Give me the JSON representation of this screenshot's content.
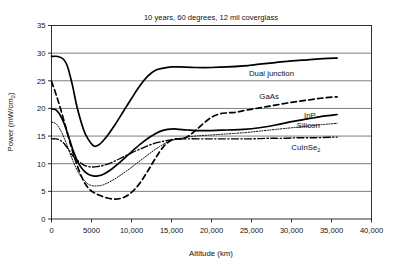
{
  "chart_data": {
    "type": "line",
    "title": "10 years, 60 degrees, 12 mil coverglass",
    "xlabel": "Altitude (km)",
    "ylabel": "Power (mW/cm2)",
    "ylabel_display": "Power (mW/cm",
    "ylabel_sub": "2",
    "ylabel_tail": ")",
    "xlim": [
      0,
      40000
    ],
    "ylim": [
      0,
      35
    ],
    "grid": "horizontal",
    "legend_position": "inline-right-annotations",
    "xticks": [
      0,
      5000,
      10000,
      15000,
      20000,
      25000,
      30000,
      35000,
      40000
    ],
    "xticklabels": [
      "0",
      "5000",
      "10,000",
      "15,000",
      "20,000",
      "25,000",
      "30,000",
      "35,000",
      "40,000"
    ],
    "yticks": [
      0,
      5,
      10,
      15,
      20,
      25,
      30,
      35
    ],
    "yticklabels": [
      "0",
      "5",
      "10",
      "15",
      "20",
      "25",
      "30",
      "35"
    ],
    "series": [
      {
        "name": "Dual junction",
        "style": "solid",
        "label_x": 27500,
        "label_y": 26.4,
        "x": [
          0,
          800,
          1500,
          2000,
          2600,
          3200,
          4000,
          4600,
          5300,
          6000,
          7000,
          8000,
          9000,
          10000,
          11000,
          12000,
          13000,
          14000,
          15000,
          16000,
          18000,
          20000,
          22000,
          24000,
          26000,
          28000,
          30000,
          32000,
          34000,
          35700
        ],
        "y": [
          29.4,
          29.4,
          28.9,
          27.6,
          24.3,
          20.2,
          16.2,
          14.4,
          13.2,
          13.5,
          15.1,
          17.2,
          19.5,
          21.8,
          24.0,
          25.8,
          26.9,
          27.3,
          27.5,
          27.5,
          27.4,
          27.4,
          27.5,
          27.7,
          28.0,
          28.3,
          28.6,
          28.8,
          29.0,
          29.1
        ]
      },
      {
        "name": "GaAs",
        "style": "dashed",
        "label_x": 27200,
        "label_y": 22.2,
        "x": [
          0,
          600,
          1200,
          1800,
          2400,
          3000,
          3600,
          4200,
          4800,
          5400,
          6000,
          7000,
          8000,
          9000,
          10000,
          11000,
          12000,
          13000,
          14000,
          15000,
          15600,
          16200,
          17000,
          18000,
          19000,
          20000,
          21000,
          22000,
          23000,
          24000,
          26000,
          28000,
          30000,
          32000,
          34000,
          35700
        ],
        "y": [
          24.9,
          22.4,
          19.6,
          16.5,
          13.4,
          10.6,
          8.2,
          6.4,
          5.3,
          4.7,
          4.3,
          3.8,
          3.6,
          3.9,
          4.8,
          6.4,
          8.6,
          11.0,
          13.1,
          14.3,
          14.5,
          14.5,
          14.9,
          16.0,
          17.3,
          18.4,
          19.0,
          19.2,
          19.3,
          19.6,
          20.1,
          20.6,
          21.1,
          21.5,
          21.9,
          22.1
        ]
      },
      {
        "name": "InP",
        "style": "solid",
        "label_x": 32300,
        "label_y": 18.8,
        "x": [
          0,
          500,
          1000,
          1600,
          2200,
          2800,
          3400,
          4000,
          4600,
          5200,
          5800,
          6500,
          7500,
          8500,
          9500,
          10500,
          11500,
          12500,
          13500,
          14500,
          15300,
          16000,
          17000,
          18000,
          20000,
          22000,
          24000,
          26000,
          28000,
          30000,
          32000,
          34000,
          35700
        ],
        "y": [
          19.9,
          19.8,
          19.0,
          17.2,
          14.6,
          12.0,
          10.0,
          8.8,
          8.1,
          7.8,
          7.8,
          8.1,
          9.0,
          10.2,
          11.5,
          12.8,
          14.0,
          15.0,
          15.8,
          16.2,
          16.3,
          16.2,
          16.1,
          16.0,
          16.0,
          16.1,
          16.2,
          16.5,
          17.0,
          17.6,
          18.1,
          18.6,
          18.9
        ]
      },
      {
        "name": "Silicon",
        "style": "dotted",
        "label_x": 32100,
        "label_y": 17.0,
        "x": [
          0,
          500,
          1000,
          1600,
          2200,
          2800,
          3400,
          4000,
          4600,
          5200,
          5800,
          6500,
          7500,
          8500,
          9500,
          10500,
          11500,
          12500,
          13500,
          14500,
          15500,
          16500,
          18000,
          20000,
          22000,
          24000,
          26000,
          28000,
          30000,
          32000,
          34000,
          35700
        ],
        "y": [
          17.5,
          17.3,
          16.4,
          14.6,
          12.3,
          10.1,
          8.3,
          7.1,
          6.3,
          6.0,
          6.0,
          6.2,
          6.9,
          7.8,
          8.8,
          9.9,
          11.0,
          12.1,
          13.1,
          13.9,
          14.4,
          14.7,
          15.0,
          15.2,
          15.4,
          15.6,
          15.9,
          16.2,
          16.5,
          16.8,
          17.1,
          17.3
        ]
      },
      {
        "name": "CuInSe2",
        "style": "dashdot",
        "label_x": 31800,
        "label_y": 13.0,
        "x": [
          0,
          500,
          1000,
          1600,
          2200,
          2800,
          3400,
          4000,
          4600,
          5200,
          5800,
          6500,
          7500,
          8500,
          9500,
          10500,
          11500,
          12500,
          13500,
          14500,
          15500,
          17000,
          19000,
          21000,
          23000,
          25000,
          27000,
          29000,
          31000,
          33000,
          35000,
          35700
        ],
        "y": [
          14.5,
          14.5,
          14.3,
          13.6,
          12.4,
          11.2,
          10.4,
          9.8,
          9.5,
          9.4,
          9.5,
          9.7,
          10.2,
          10.9,
          11.6,
          12.3,
          12.9,
          13.5,
          13.9,
          14.2,
          14.4,
          14.5,
          14.5,
          14.5,
          14.5,
          14.5,
          14.6,
          14.6,
          14.7,
          14.7,
          14.8,
          14.8
        ]
      }
    ]
  }
}
